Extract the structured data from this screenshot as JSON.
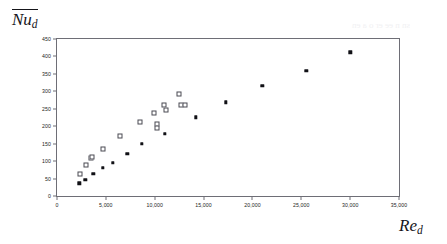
{
  "figure": {
    "y_axis_title_main": "Nu",
    "y_axis_title_sub": "d",
    "x_axis_title_main": "Re",
    "x_axis_title_sub": "d",
    "bleed_text_lower": "lnu TS:S, llsbruoterb'uA :ro0 es s ee",
    "bleed_text_upper": "sn n ee er o a en"
  },
  "chart_data": {
    "type": "scatter",
    "title": "",
    "xlabel": "Re_d",
    "ylabel": "Nu_d",
    "xlim": [
      0,
      35000
    ],
    "ylim": [
      0,
      450
    ],
    "grid": false,
    "legend": "none",
    "x_ticks": [
      0,
      5000,
      10000,
      15000,
      20000,
      25000,
      30000,
      35000
    ],
    "x_tick_labels": [
      "0",
      "5,000",
      "10,000",
      "15,000",
      "20,000",
      "25,000",
      "30,000",
      "35,000"
    ],
    "y_ticks": [
      0,
      50,
      100,
      150,
      200,
      250,
      300,
      350,
      400,
      450
    ],
    "y_tick_labels": [
      "0",
      "50",
      "100",
      "150",
      "200",
      "250",
      "300",
      "350",
      "400",
      "450"
    ],
    "series": [
      {
        "name": "open-square-series",
        "marker": "open-square",
        "color": "#4a4a53",
        "points": [
          [
            2400,
            62
          ],
          [
            3000,
            90
          ],
          [
            3500,
            108
          ],
          [
            3620,
            112
          ],
          [
            4700,
            134
          ],
          [
            6400,
            172
          ],
          [
            8500,
            212
          ],
          [
            9900,
            237
          ],
          [
            10200,
            205
          ],
          [
            10250,
            196
          ],
          [
            11000,
            260
          ],
          [
            11150,
            247
          ],
          [
            12500,
            291
          ],
          [
            12650,
            261
          ],
          [
            13050,
            261
          ]
        ]
      },
      {
        "name": "filled-diamond-series",
        "marker": "filled-diamond",
        "color": "#111116",
        "points": [
          [
            2300,
            36
          ],
          [
            2900,
            47
          ],
          [
            3700,
            63
          ],
          [
            4700,
            80
          ],
          [
            5700,
            96
          ],
          [
            7200,
            121
          ],
          [
            8700,
            150
          ],
          [
            11050,
            179
          ],
          [
            14200,
            226
          ],
          [
            17300,
            269
          ],
          [
            21000,
            316
          ],
          [
            25500,
            359
          ],
          [
            30000,
            412
          ]
        ]
      }
    ]
  }
}
